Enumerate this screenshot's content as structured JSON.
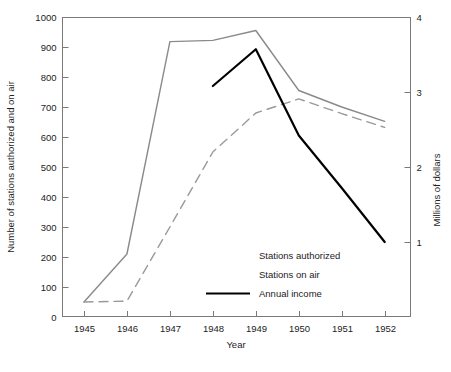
{
  "chart_data": {
    "type": "line",
    "title": "",
    "xlabel": "Year",
    "ylabel": "Number of stations authorized and on air",
    "y2label": "Millions of dollars",
    "x": [
      1945,
      1946,
      1947,
      1948,
      1949,
      1950,
      1951,
      1952
    ],
    "xticklabels": [
      "1945",
      "1946",
      "1947",
      "1948",
      "1949",
      "1950",
      "1951",
      "1952"
    ],
    "xlim": [
      1944.5,
      1952.6
    ],
    "ylim": [
      0,
      1000
    ],
    "yticks": [
      0,
      100,
      200,
      300,
      400,
      500,
      600,
      700,
      800,
      900,
      1000
    ],
    "yticklabels": [
      "0",
      "100",
      "200",
      "300",
      "400",
      "500",
      "600",
      "700",
      "800",
      "900",
      "1000"
    ],
    "y2lim": [
      0,
      4
    ],
    "y2ticks": [
      1,
      2,
      3,
      4
    ],
    "y2ticklabels": [
      "1",
      "2",
      "3",
      "4"
    ],
    "grid": false,
    "legend_position": "inside lower right",
    "series": [
      {
        "name": "Stations authorized",
        "axis": "left",
        "style": "solid",
        "color": "#8a8a8a",
        "x": [
          1945,
          1946,
          1947,
          1948,
          1949,
          1950,
          1951,
          1952
        ],
        "values": [
          50,
          210,
          918,
          922,
          955,
          755,
          700,
          652
        ]
      },
      {
        "name": "Stations on air",
        "axis": "left",
        "style": "dashed",
        "color": "#9a9a9a",
        "x": [
          1945,
          1946,
          1947,
          1948,
          1949,
          1950,
          1951,
          1952
        ],
        "values": [
          50,
          53,
          300,
          550,
          680,
          727,
          678,
          632
        ]
      },
      {
        "name": "Annual income",
        "axis": "right",
        "style": "solid",
        "color": "#000000",
        "x": [
          1948,
          1949,
          1950,
          1951,
          1952
        ],
        "values": [
          3.08,
          3.57,
          2.42,
          1.72,
          1.0
        ]
      }
    ]
  },
  "axes": {
    "x_title": "Year",
    "y_left_title": "Number of stations authorized and on air",
    "y_right_title": "Millions of dollars"
  },
  "legend": {
    "entries": [
      {
        "label": "Stations authorized",
        "swatch": "none"
      },
      {
        "label": "Stations on air",
        "swatch": "none"
      },
      {
        "label": "Annual income",
        "swatch": "solid-black-line"
      }
    ]
  }
}
